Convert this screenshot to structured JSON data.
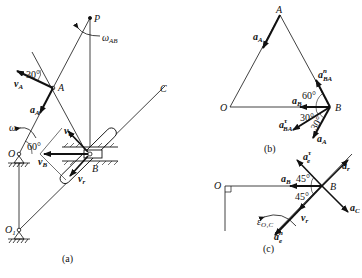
{
  "figure": {
    "panels": [
      {
        "id": "a",
        "caption": "(a)"
      },
      {
        "id": "b",
        "caption": "(b)"
      },
      {
        "id": "c",
        "caption": "(c)"
      }
    ]
  },
  "panel_a": {
    "points": {
      "O": "O",
      "A": "A",
      "B": "B",
      "C": "C",
      "P": "P",
      "O1": "O",
      "O1_sub": "1"
    },
    "vectors": {
      "vA": "v",
      "vA_sub": "A",
      "aA": "a",
      "aA_sub": "A",
      "vB": "v",
      "vB_sub": "B",
      "ve": "v",
      "ve_sub": "e",
      "vr": "v",
      "vr_sub": "r"
    },
    "angular": {
      "omega": "ω",
      "omega_AB": "ω",
      "omega_AB_sub": "AB"
    },
    "angles": {
      "angle_30": "30°",
      "angle_60": "60°"
    },
    "caption": "(a)"
  },
  "panel_b": {
    "points": {
      "A": "A",
      "O": "O",
      "B": "B"
    },
    "vectors": {
      "aA_top": "a",
      "aA_top_sub": "A",
      "aBA_n": "a",
      "aBA_n_sup": "n",
      "aBA_n_sub": "BA",
      "aB": "a",
      "aB_sub": "B",
      "aBA_t": "a",
      "aBA_t_sup": "τ",
      "aBA_t_sub": "BA",
      "aA_bottom": "a",
      "aA_bottom_sub": "A"
    },
    "angles": {
      "angle_60": "60°",
      "angle_30a": "30°",
      "angle_30b": "30°"
    },
    "caption": "(b)"
  },
  "panel_c": {
    "points": {
      "O": "O",
      "B": "B"
    },
    "vectors": {
      "ae_t": "a",
      "ae_t_sup": "τ",
      "ae_t_sub": "e",
      "ar": "a",
      "ar_sub": "r",
      "aB": "a",
      "aB_sub": "B",
      "aC": "a",
      "aC_sub": "C",
      "vr": "v",
      "vr_sub": "r",
      "ae_n": "a",
      "ae_n_sup": "n",
      "ae_n_sub": "e"
    },
    "angular": {
      "epsilon": "ε",
      "epsilon_sub": "O₁C"
    },
    "angles": {
      "angle_45a": "45°",
      "angle_45b": "45°"
    },
    "caption": "(c)"
  }
}
